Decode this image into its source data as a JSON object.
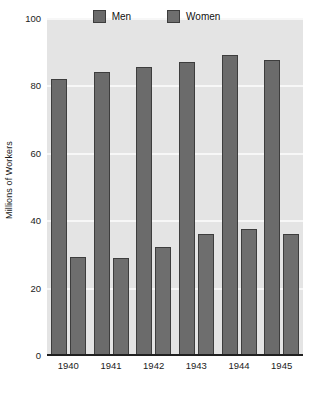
{
  "chart_data": {
    "type": "bar",
    "title": "",
    "xlabel": "",
    "ylabel": "Millions of Workers",
    "categories": [
      "1940",
      "1941",
      "1942",
      "1943",
      "1944",
      "1945"
    ],
    "series": [
      {
        "name": "Men",
        "color": "#6b6b6b",
        "values": [
          82,
          84,
          85.5,
          87,
          89,
          87.5
        ]
      },
      {
        "name": "Women",
        "color": "#6e6e6e",
        "values": [
          29,
          28.8,
          32,
          36,
          37.5,
          35.8
        ]
      }
    ],
    "ylim": [
      0,
      100
    ],
    "yticks": [
      0,
      20,
      40,
      60,
      80,
      100
    ],
    "ytick_labels": [
      "0",
      "20",
      "40",
      "60",
      "80",
      "100"
    ],
    "grid": true,
    "grid_color": "#f7f7f7",
    "plot_background": "#e4e4e4",
    "page_background": "#ffffff",
    "bar_edge_color": "#3d3d3d",
    "axis_color": "#202020",
    "legend": {
      "position": "top-center",
      "entries": [
        {
          "label": "Men",
          "color": "#6b6b6b"
        },
        {
          "label": "Women",
          "color": "#6e6e6e"
        }
      ]
    }
  }
}
